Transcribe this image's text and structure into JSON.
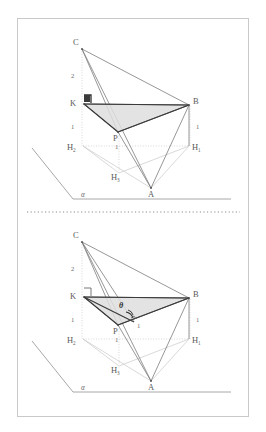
{
  "figure": {
    "background_color": "#ffffff",
    "frame_border_color": "#c9c9c9",
    "divider": {
      "name": "dotted-divider",
      "style": "dotted",
      "color": "#8a8a8a"
    },
    "colors": {
      "solid_line": "#6f6f6f",
      "dashed_line": "#b5b5b5",
      "dotted_line": "#bdbdbd",
      "shade_fill": "#dcdcdc",
      "shade_stroke": "#4a4a4a",
      "ground_line": "#9a9a9a",
      "label": "#5a5a5a",
      "accent": "#2f2f2f"
    },
    "panels": [
      {
        "id": "top-panel",
        "name": "geometry-diagram-top",
        "vertices": [
          {
            "name": "C",
            "label": "C",
            "x": 79,
            "y": 45
          },
          {
            "name": "K",
            "label": "K",
            "x": 79,
            "y": 103
          },
          {
            "name": "B",
            "label": "B",
            "x": 193,
            "y": 103
          },
          {
            "name": "P",
            "label": "P",
            "x": 117,
            "y": 131
          },
          {
            "name": "A",
            "label": "A",
            "x": 152,
            "y": 192
          },
          {
            "name": "H1",
            "label": "H",
            "sub": "1",
            "x": 193,
            "y": 148
          },
          {
            "name": "H2",
            "label": "H",
            "sub": "2",
            "x": 79,
            "y": 148
          },
          {
            "name": "H3",
            "label": "H",
            "sub": "3",
            "x": 117,
            "y": 176
          }
        ],
        "measure_labels": [
          {
            "name": "segment-length-ck",
            "text": "2",
            "x": 72,
            "y": 76
          },
          {
            "name": "segment-length-kh2",
            "text": "1",
            "x": 72,
            "y": 127
          },
          {
            "name": "segment-length-bh1",
            "text": "1",
            "x": 198,
            "y": 127
          },
          {
            "name": "segment-length-h2h3",
            "text": "1",
            "x": 117,
            "y": 147
          }
        ],
        "plane_label": {
          "name": "plane-alpha-label",
          "text": "α",
          "x": 84,
          "y": 197
        },
        "right_angle_marker": {
          "name": "right-angle-marker-k",
          "x": 82,
          "y": 95
        }
      },
      {
        "id": "bottom-panel",
        "name": "geometry-diagram-bottom",
        "vertices": [
          {
            "name": "C",
            "label": "C",
            "x": 79,
            "y": 238
          },
          {
            "name": "K",
            "label": "K",
            "x": 79,
            "y": 296
          },
          {
            "name": "B",
            "label": "B",
            "x": 193,
            "y": 296
          },
          {
            "name": "P",
            "label": "P",
            "x": 117,
            "y": 324
          },
          {
            "name": "A",
            "label": "A",
            "x": 152,
            "y": 385
          },
          {
            "name": "H1",
            "label": "H",
            "sub": "1",
            "x": 193,
            "y": 341
          },
          {
            "name": "H2",
            "label": "H",
            "sub": "2",
            "x": 79,
            "y": 341
          },
          {
            "name": "H3",
            "label": "H",
            "sub": "3",
            "x": 117,
            "y": 369
          }
        ],
        "measure_labels": [
          {
            "name": "segment-length-ck",
            "text": "2",
            "x": 72,
            "y": 269
          },
          {
            "name": "segment-length-kh2",
            "text": "1",
            "x": 72,
            "y": 320
          },
          {
            "name": "segment-length-bh1",
            "text": "1",
            "x": 198,
            "y": 320
          },
          {
            "name": "segment-length-h2h3",
            "text": "1",
            "x": 117,
            "y": 340
          },
          {
            "name": "segment-length-p-mid",
            "text": "1",
            "x": 133,
            "y": 325
          }
        ],
        "angle_label": {
          "name": "angle-theta-label",
          "text": "θ",
          "x": 122,
          "y": 305
        },
        "plane_label": {
          "name": "plane-alpha-label",
          "text": "α",
          "x": 84,
          "y": 390
        },
        "right_angle_marker": {
          "name": "right-angle-marker-k",
          "x": 82,
          "y": 288
        }
      }
    ]
  }
}
